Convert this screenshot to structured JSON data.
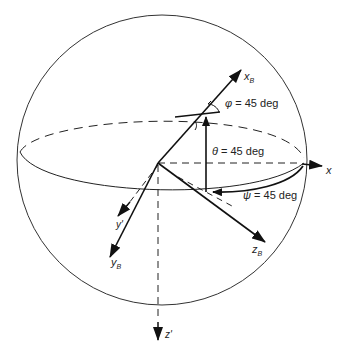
{
  "diagram": {
    "axes": {
      "xB": {
        "main": "x",
        "sub": "B"
      },
      "yB": {
        "main": "y",
        "sub": "B"
      },
      "zB": {
        "main": "z",
        "sub": "B"
      },
      "x": "x",
      "y_prime": "y'",
      "z_prime": "z'"
    },
    "angles": {
      "phi": {
        "symbol": "φ",
        "text": " = 45 deg"
      },
      "theta": {
        "symbol": "θ",
        "text": " = 45 deg"
      },
      "psi": {
        "symbol": "ψ",
        "text": " = 45 deg"
      }
    },
    "colors": {
      "stroke": "#111111",
      "sphere": "#333333",
      "background": "#ffffff"
    }
  }
}
